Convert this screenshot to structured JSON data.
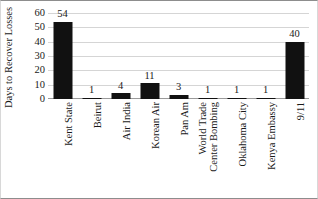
{
  "chart_data": {
    "type": "bar",
    "title": "",
    "xlabel": "",
    "ylabel": "Days to Recover Losses",
    "ylim": [
      0,
      60
    ],
    "yticks": [
      0,
      10,
      20,
      30,
      40,
      50,
      60
    ],
    "grid": true,
    "legend": false,
    "bar_color": "#111111",
    "categories": [
      "Kent State",
      "Beirut",
      "Air India",
      "Korean Air",
      "Pan Am",
      "World Trade Center Bombing",
      "Oklahoma City",
      "Kenya Embassy",
      "9/11"
    ],
    "category_lines": [
      [
        "Kent State"
      ],
      [
        "Beirut"
      ],
      [
        "Air India"
      ],
      [
        "Korean Air"
      ],
      [
        "Pan Am"
      ],
      [
        "World Trade",
        "Center Bombing"
      ],
      [
        "Oklahoma City"
      ],
      [
        "Kenya Embassy"
      ],
      [
        "9/11"
      ]
    ],
    "values": [
      54,
      1,
      4,
      11,
      3,
      1,
      1,
      1,
      40
    ],
    "data_labels": [
      "54",
      "1",
      "4",
      "11",
      "3",
      "1",
      "1",
      "1",
      "40"
    ]
  },
  "axis": {
    "y_tick_labels": [
      "60",
      "50",
      "40",
      "30",
      "20",
      "10",
      "0"
    ]
  },
  "colors": {
    "bar": "#111111",
    "gridline": "#d5d5d5",
    "axis": "#9a9a9a",
    "text": "#1a1a1a",
    "background": "#ffffff"
  }
}
